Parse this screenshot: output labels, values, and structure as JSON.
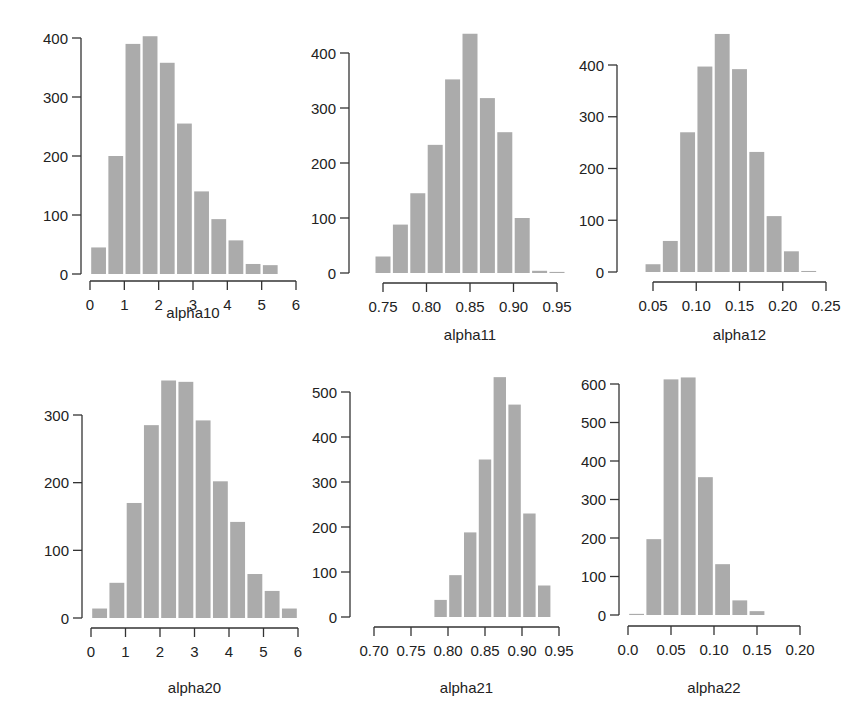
{
  "figure": {
    "bar_color": "#ababab",
    "axis_color": "#333333",
    "background": "#ffffff"
  },
  "chart_data": [
    {
      "type": "bar",
      "title": "",
      "xlabel": "alpha10",
      "ylabel": "",
      "bin_width": 0.5,
      "bin_start": 0.0,
      "values": [
        45,
        200,
        390,
        403,
        358,
        255,
        140,
        93,
        57,
        17,
        15
      ],
      "xticks": [
        "0",
        "1",
        "2",
        "3",
        "4",
        "5",
        "6"
      ],
      "xtick_values": [
        0,
        1,
        2,
        3,
        4,
        5,
        6
      ],
      "yticks": [
        "0",
        "100",
        "200",
        "300",
        "400"
      ],
      "ytick_values": [
        0,
        100,
        200,
        300,
        400
      ],
      "xlim": [
        0,
        6
      ],
      "ylim": [
        0,
        400
      ],
      "grid": false,
      "layout": {
        "yaxis_x": 81,
        "y0_px": 274,
        "ytop_val": 400,
        "ytop_px": 38,
        "xaxis_y": 281,
        "x0_px": 90,
        "x1_px": 296,
        "xlabel_y": 318
      }
    },
    {
      "type": "bar",
      "title": "",
      "xlabel": "alpha11",
      "ylabel": "",
      "bin_width": 0.02,
      "bin_start": 0.74,
      "values": [
        30,
        88,
        145,
        233,
        352,
        435,
        318,
        256,
        100,
        4,
        2
      ],
      "xticks": [
        "0.75",
        "0.80",
        "0.85",
        "0.90",
        "0.95"
      ],
      "xtick_values": [
        0.75,
        0.8,
        0.85,
        0.9,
        0.95
      ],
      "yticks": [
        "0",
        "100",
        "200",
        "300",
        "400"
      ],
      "ytick_values": [
        0,
        100,
        200,
        300,
        400
      ],
      "xlim": [
        0.75,
        0.95
      ],
      "ylim": [
        0,
        400
      ],
      "grid": false,
      "layout": {
        "yaxis_x": 349,
        "y0_px": 273,
        "ytop_val": 400,
        "ytop_px": 53,
        "xaxis_y": 283,
        "x0_px": 383,
        "x1_px": 557,
        "xlabel_y": 340
      }
    },
    {
      "type": "bar",
      "title": "",
      "xlabel": "alpha12",
      "ylabel": "",
      "bin_width": 0.02,
      "bin_start": 0.04,
      "values": [
        15,
        60,
        270,
        397,
        460,
        392,
        232,
        108,
        40,
        2
      ],
      "xticks": [
        "0.05",
        "0.10",
        "0.15",
        "0.20",
        "0.25"
      ],
      "xtick_values": [
        0.05,
        0.1,
        0.15,
        0.2,
        0.25
      ],
      "yticks": [
        "0",
        "100",
        "200",
        "300",
        "400"
      ],
      "ytick_values": [
        0,
        100,
        200,
        300,
        400
      ],
      "xlim": [
        0.05,
        0.25
      ],
      "ylim": [
        0,
        400
      ],
      "grid": false,
      "layout": {
        "yaxis_x": 617,
        "y0_px": 272,
        "ytop_val": 400,
        "ytop_px": 65,
        "xaxis_y": 282,
        "x0_px": 653,
        "x1_px": 826,
        "xlabel_y": 340
      }
    },
    {
      "type": "bar",
      "title": "",
      "xlabel": "alpha20",
      "ylabel": "",
      "bin_width": 0.5,
      "bin_start": 0.0,
      "values": [
        14,
        52,
        170,
        285,
        351,
        349,
        292,
        202,
        142,
        65,
        40,
        14
      ],
      "xticks": [
        "0",
        "1",
        "2",
        "3",
        "4",
        "5",
        "6"
      ],
      "xtick_values": [
        0,
        1,
        2,
        3,
        4,
        5,
        6
      ],
      "yticks": [
        "0",
        "100",
        "200",
        "300"
      ],
      "ytick_values": [
        0,
        100,
        200,
        300
      ],
      "xlim": [
        0,
        6
      ],
      "ylim": [
        0,
        300
      ],
      "grid": false,
      "layout": {
        "yaxis_x": 82,
        "y0_px": 618,
        "ytop_val": 300,
        "ytop_px": 415,
        "xaxis_y": 628,
        "x0_px": 91,
        "x1_px": 298,
        "xlabel_y": 693
      }
    },
    {
      "type": "bar",
      "title": "",
      "xlabel": "alpha21",
      "ylabel": "",
      "bin_width": 0.02,
      "bin_start": 0.78,
      "values": [
        38,
        93,
        188,
        350,
        533,
        472,
        230,
        70
      ],
      "xticks": [
        "0.70",
        "0.75",
        "0.80",
        "0.85",
        "0.90",
        "0.95"
      ],
      "xtick_values": [
        0.7,
        0.75,
        0.8,
        0.85,
        0.9,
        0.95
      ],
      "yticks": [
        "0",
        "100",
        "200",
        "300",
        "400",
        "500"
      ],
      "ytick_values": [
        0,
        100,
        200,
        300,
        400,
        500
      ],
      "xlim": [
        0.7,
        0.95
      ],
      "ylim": [
        0,
        500
      ],
      "grid": false,
      "layout": {
        "yaxis_x": 350,
        "y0_px": 617,
        "ytop_val": 500,
        "ytop_px": 392,
        "xaxis_y": 627,
        "x0_px": 374,
        "x1_px": 559,
        "xlabel_y": 693
      }
    },
    {
      "type": "bar",
      "title": "",
      "xlabel": "alpha22",
      "ylabel": "",
      "bin_width": 0.02,
      "bin_start": 0.0,
      "values": [
        3,
        197,
        612,
        617,
        358,
        132,
        38,
        10
      ],
      "xticks": [
        "0.0",
        "0.05",
        "0.10",
        "0.15",
        "0.20"
      ],
      "xtick_values": [
        0.0,
        0.05,
        0.1,
        0.15,
        0.2
      ],
      "yticks": [
        "0",
        "100",
        "200",
        "300",
        "400",
        "500",
        "600"
      ],
      "ytick_values": [
        0,
        100,
        200,
        300,
        400,
        500,
        600
      ],
      "xlim": [
        0.0,
        0.2
      ],
      "ylim": [
        0,
        600
      ],
      "grid": false,
      "layout": {
        "yaxis_x": 619,
        "y0_px": 615,
        "ytop_val": 600,
        "ytop_px": 384,
        "xaxis_y": 626,
        "x0_px": 628,
        "x1_px": 800,
        "xlabel_y": 693
      }
    }
  ]
}
